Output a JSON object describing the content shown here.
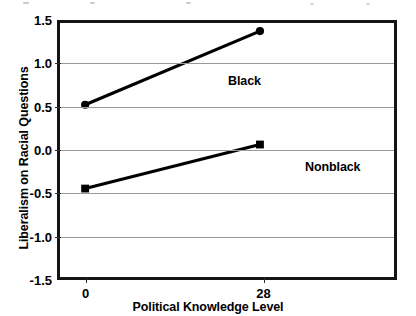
{
  "chart_data": {
    "type": "line",
    "title": "",
    "xlabel": "Political Knowledge Level",
    "ylabel": "Liberalism on Racial Questions",
    "x": [
      0,
      28
    ],
    "xtick_labels": [
      "0",
      "28"
    ],
    "xlim": [
      -4.5,
      49
    ],
    "ylim": [
      -1.5,
      1.5
    ],
    "ytick_labels": [
      "1.5",
      "1.0",
      "0.5",
      "0.0",
      "-0.5",
      "-1.0",
      "-1.5"
    ],
    "ytick_values": [
      1.5,
      1.0,
      0.5,
      0.0,
      -0.5,
      -1.0,
      -1.5
    ],
    "grid": true,
    "grid_axis": "y",
    "legend": "inline-labels",
    "series": [
      {
        "name": "Black",
        "marker": "circle",
        "color": "#000000",
        "values": [
          0.5,
          1.37
        ],
        "label_text": "Black"
      },
      {
        "name": "Nonblack",
        "marker": "square",
        "color": "#000000",
        "values": [
          -0.49,
          0.03
        ],
        "label_text": "Nonblack"
      }
    ]
  },
  "axes": {
    "y_title": "Liberalism on Racial Questions",
    "x_title": "Political Knowledge Level",
    "y_ticks": [
      {
        "label": "1.5",
        "value": 1.5
      },
      {
        "label": "1.0",
        "value": 1.0
      },
      {
        "label": "0.5",
        "value": 0.5
      },
      {
        "label": "0.0",
        "value": 0.0
      },
      {
        "label": "-0.5",
        "value": -0.5
      },
      {
        "label": "-1.0",
        "value": -1.0
      },
      {
        "label": "-1.5",
        "value": -1.5
      }
    ],
    "x_ticks": [
      {
        "label": "0",
        "value": 0
      },
      {
        "label": "28",
        "value": 28
      }
    ]
  },
  "annotations": [
    {
      "name": "black-series-label",
      "text": "Black"
    },
    {
      "name": "nonblack-series-label",
      "text": "Nonblack"
    }
  ],
  "colors": {
    "frame": "#141414",
    "gridline": "#9a9a9a",
    "series": "#000000",
    "background": "#ffffff"
  }
}
